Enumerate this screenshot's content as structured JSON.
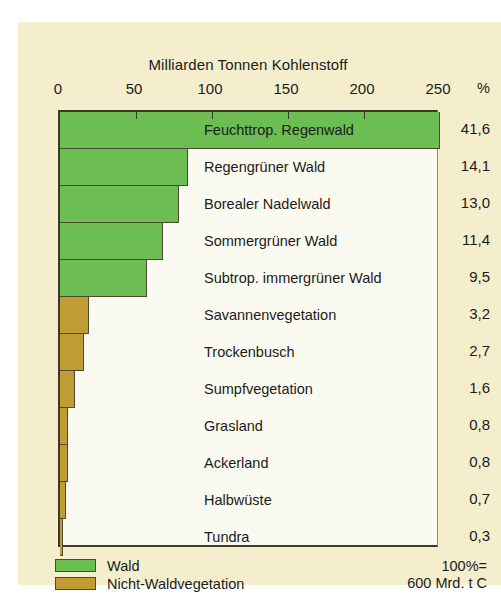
{
  "chart_data": {
    "type": "bar",
    "orientation": "horizontal",
    "title": "Milliarden Tonnen Kohlenstoff",
    "xlabel": "Milliarden Tonnen Kohlenstoff",
    "ylabel": "",
    "xlim": [
      0,
      250
    ],
    "xticks": [
      0,
      50,
      100,
      150,
      200,
      250
    ],
    "xtick_labels": [
      "0",
      "50",
      "100",
      "150",
      "200",
      "250"
    ],
    "grid": false,
    "value_column_header": "%",
    "categories": [
      "Feuchttrop. Regenwald",
      "Regengrüner Wald",
      "Borealer Nadelwald",
      "Sommergrüner Wald",
      "Subtrop. immergrüner Wald",
      "Savannenvegetation",
      "Trockenbusch",
      "Sumpfvegetation",
      "Grasland",
      "Ackerland",
      "Halbwüste",
      "Tundra"
    ],
    "values": [
      250,
      84,
      78,
      68,
      57,
      19,
      16,
      10,
      5,
      5,
      4,
      2
    ],
    "percent_labels": [
      "41,6",
      "14,1",
      "13,0",
      "11,4",
      "9,5",
      "3,2",
      "2,7",
      "1,6",
      "0,8",
      "0,8",
      "0,7",
      "0,3"
    ],
    "groups": [
      "wald",
      "wald",
      "wald",
      "wald",
      "wald",
      "nicht",
      "nicht",
      "nicht",
      "nicht",
      "nicht",
      "nicht",
      "nicht"
    ],
    "legend": {
      "position": "bottom-left",
      "entries": [
        {
          "label": "Wald",
          "color": "#6cbd52",
          "key": "wald"
        },
        {
          "label": "Nicht-Waldvegetation",
          "color": "#c19b33",
          "key": "nicht"
        }
      ]
    },
    "annotations": {
      "total_line1": "100%=",
      "total_line2": "600 Mrd. t C"
    },
    "colors": {
      "green": "#6cbd52",
      "olive": "#c19b33",
      "card_background": "#f4eecd",
      "plot_background": "#fbfaf0",
      "axis": "#3a3a2a",
      "text": "#1b1b1b"
    }
  }
}
